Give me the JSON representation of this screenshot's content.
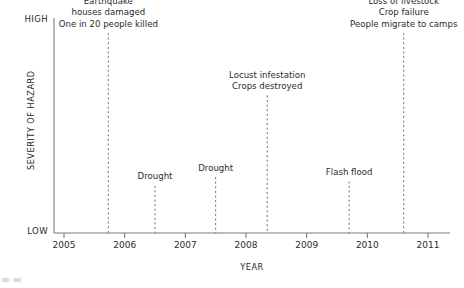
{
  "chart_data": {
    "type": "scatter",
    "title": "",
    "xlabel": "YEAR",
    "ylabel": "SEVERITY OF HAZARD",
    "xlim": [
      2004.83,
      2011.33
    ],
    "ylim": [
      0,
      1
    ],
    "grid": false,
    "legend": null,
    "y_axis_ticks": [
      "HIGH",
      "LOW"
    ],
    "x_axis_ticks": [
      "2005",
      "2006",
      "2007",
      "2008",
      "2009",
      "2010",
      "2011"
    ],
    "x_tick_values": [
      2005,
      2006,
      2007,
      2008,
      2009,
      2010,
      2011
    ],
    "annotations": [
      {
        "id": "earthquake",
        "year": 2005.73,
        "severity": 0.93,
        "lines": [
          "Earthquake",
          "houses damaged",
          "One in 20 people killed"
        ]
      },
      {
        "id": "drought-2006",
        "year": 2006.5,
        "severity": 0.22,
        "lines": [
          "Drought"
        ]
      },
      {
        "id": "drought-2007",
        "year": 2007.5,
        "severity": 0.26,
        "lines": [
          "Drought"
        ]
      },
      {
        "id": "locust-infestation",
        "year": 2008.35,
        "severity": 0.64,
        "lines": [
          "Locust infestation",
          "Crops destroyed"
        ]
      },
      {
        "id": "flash-flood",
        "year": 2009.7,
        "severity": 0.24,
        "lines": [
          "Flash flood"
        ]
      },
      {
        "id": "severe-drought",
        "year": 2010.6,
        "severity": 0.93,
        "lines": [
          "Severe drought",
          "Wells dried up",
          "Loss of livestock",
          "Crop failure",
          "People migrate to camps"
        ]
      }
    ]
  },
  "colors": {
    "axis": "#7a7a7a",
    "text": "#2b2b2b",
    "marker_line": "#6e6e6e",
    "background": "#ffffff"
  },
  "artifact": {
    "bottom_left_text": "▃ ▃"
  }
}
